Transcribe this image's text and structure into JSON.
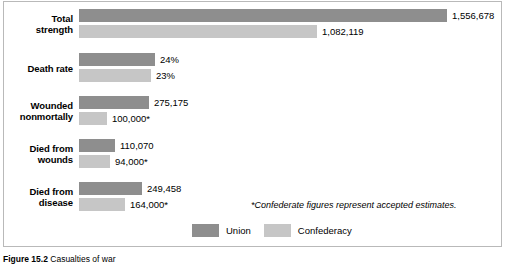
{
  "figure": {
    "caption_number": "Figure 15.2",
    "caption_text": "Casualties of war"
  },
  "footnote": "*Confederate figures represent accepted estimates.",
  "legend": {
    "position": "bottom-center",
    "entries": [
      {
        "label": "Union",
        "color": "#8e8e8e"
      },
      {
        "label": "Confederacy",
        "color": "#c6c6c6"
      }
    ]
  },
  "chart_data": {
    "type": "bar",
    "orientation": "horizontal",
    "grouped": true,
    "title": "Casualties of war",
    "xlabel": "",
    "ylabel": "",
    "grid": false,
    "legend_position": "bottom-center",
    "annotations": [
      "*Confederate figures represent accepted estimates."
    ],
    "categories": [
      "Total strength",
      "Death rate",
      "Wounded nonmortally",
      "Died from wounds",
      "Died from disease"
    ],
    "series": [
      {
        "name": "Union",
        "color": "#8e8e8e",
        "values": [
          1556678,
          24,
          275175,
          110070,
          249458
        ],
        "labels": [
          "1,556,678",
          "24%",
          "275,175",
          "110,070",
          "249,458"
        ]
      },
      {
        "name": "Confederacy",
        "color": "#c6c6c6",
        "values": [
          1082119,
          23,
          100000,
          94000,
          164000
        ],
        "labels": [
          "1,082,119",
          "23%",
          "100,000*",
          "94,000*",
          "164,000*"
        ]
      }
    ],
    "groups": [
      {
        "label_lines": [
          "Total",
          "strength"
        ],
        "union": {
          "label": "1,556,678",
          "bar_width": 368
        },
        "conf": {
          "label": "1,082,119",
          "bar_width": 238
        }
      },
      {
        "label_lines": [
          "Death rate"
        ],
        "union": {
          "label": "24%",
          "bar_width": 76
        },
        "conf": {
          "label": "23%",
          "bar_width": 72
        }
      },
      {
        "label_lines": [
          "Wounded",
          "nonmortally"
        ],
        "union": {
          "label": "275,175",
          "bar_width": 70
        },
        "conf": {
          "label": "100,000*",
          "bar_width": 28
        }
      },
      {
        "label_lines": [
          "Died from",
          "wounds"
        ],
        "union": {
          "label": "110,070",
          "bar_width": 36
        },
        "conf": {
          "label": "94,000*",
          "bar_width": 31
        }
      },
      {
        "label_lines": [
          "Died from",
          "disease"
        ],
        "union": {
          "label": "249,458",
          "bar_width": 63
        },
        "conf": {
          "label": "164,000*",
          "bar_width": 46
        }
      }
    ]
  }
}
